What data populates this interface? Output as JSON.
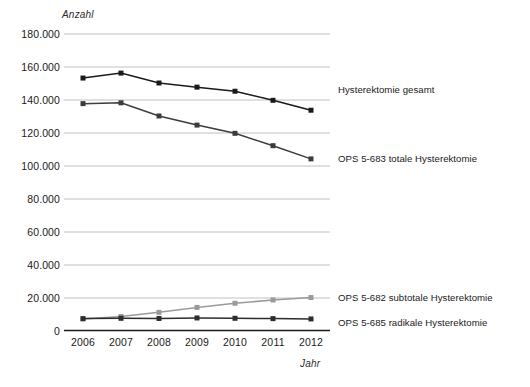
{
  "chart_data": {
    "type": "line",
    "title": "",
    "xlabel": "Jahr",
    "ylabel": "Anzahl",
    "categories": [
      "2006",
      "2007",
      "2008",
      "2009",
      "2010",
      "2011",
      "2012"
    ],
    "x": [
      2006,
      2007,
      2008,
      2009,
      2010,
      2011,
      2012
    ],
    "ylim": [
      0,
      180000
    ],
    "ytick_values": [
      0,
      20000,
      40000,
      60000,
      80000,
      100000,
      120000,
      140000,
      160000,
      180000
    ],
    "ytick_labels": [
      "0",
      "20.000",
      "40.000",
      "60.000",
      "80.000",
      "100.000",
      "120.000",
      "140.000",
      "160.000",
      "180.000"
    ],
    "grid": true,
    "legend_position": "right-inline",
    "series": [
      {
        "name": "Hysterektomie gesamt",
        "color": "#1a1a1a",
        "marker": "square",
        "values": [
          153000,
          156000,
          150000,
          147500,
          145000,
          139500,
          133500
        ]
      },
      {
        "name": "OPS 5-683 totale Hysterektomie",
        "color": "#3c3c3c",
        "marker": "square",
        "values": [
          137500,
          138000,
          130000,
          124500,
          119500,
          112000,
          104000
        ]
      },
      {
        "name": "OPS 5-682 subtotale Hysterektomie",
        "color": "#9a9a9a",
        "marker": "square",
        "values": [
          7000,
          8500,
          11000,
          14000,
          16500,
          18500,
          20000
        ]
      },
      {
        "name": "OPS 5-685 radikale Hysterektomie",
        "color": "#2d2d2d",
        "marker": "square",
        "values": [
          7200,
          7400,
          7300,
          7600,
          7400,
          7200,
          7000
        ]
      }
    ]
  },
  "labels": {
    "y_axis_caption": "Anzahl",
    "x_axis_caption": "Jahr",
    "series_1": "Hysterektomie gesamt",
    "series_2": "OPS 5-683 totale Hysterektomie",
    "series_3": "OPS 5-682 subtotale Hysterektomie",
    "series_4": "OPS 5-685 radikale Hysterektomie"
  },
  "colors": {
    "gridline": "#b9b9b9",
    "axis": "#1a1a1a",
    "series_total": "#1a1a1a",
    "series_totale": "#3c3c3c",
    "series_subtotale": "#9a9a9a",
    "series_radikale": "#2d2d2d",
    "background": "#ffffff"
  }
}
